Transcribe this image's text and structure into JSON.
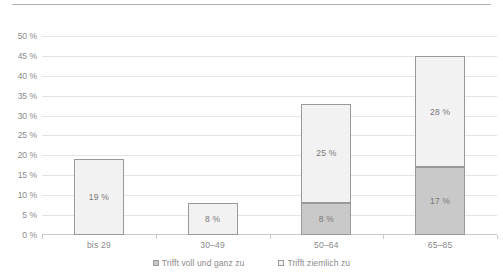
{
  "chart_data": {
    "type": "bar",
    "subtype": "stacked-column",
    "title": "",
    "xlabel": "",
    "ylabel": "",
    "categories": [
      "bis 29",
      "30–49",
      "50–64",
      "65–85"
    ],
    "series": [
      {
        "name": "Trifft voll und ganz zu",
        "values": [
          0,
          0,
          8,
          17
        ],
        "labels": [
          "0 %",
          "0 %",
          "8 %",
          "17 %"
        ],
        "color": "#c9c9c9"
      },
      {
        "name": "Trifft ziemlich zu",
        "values": [
          19,
          8,
          25,
          28
        ],
        "labels": [
          "19 %",
          "8 %",
          "25 %",
          "28 %"
        ],
        "color": "#f2f2f2"
      }
    ],
    "totals": [
      19,
      8,
      33,
      45
    ],
    "ylim": [
      0,
      52
    ],
    "yticks": [
      0,
      5,
      10,
      15,
      20,
      25,
      30,
      35,
      40,
      45,
      50
    ],
    "ytick_labels": [
      "0 %",
      "5 %",
      "10 %",
      "15 %",
      "20 %",
      "25 %",
      "30 %",
      "35 %",
      "40 %",
      "45 %",
      "50 %"
    ],
    "grid": true,
    "legend_position": "bottom"
  },
  "legend": {
    "items": [
      {
        "label": "Trifft voll und ganz zu",
        "swatch": "dark"
      },
      {
        "label": "Trifft ziemlich zu",
        "swatch": "light"
      }
    ]
  }
}
